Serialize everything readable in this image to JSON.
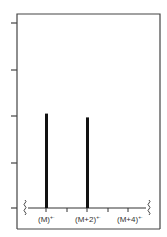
{
  "chart_data": {
    "type": "bar",
    "title": "",
    "xlabel": "",
    "ylabel": "",
    "categories": [
      "(M)+·",
      "(M+2)+·",
      "(M+4)+·"
    ],
    "values": [
      51,
      49,
      0
    ],
    "ylim": [
      0,
      100
    ],
    "y_ticks_count": 5,
    "y_tick_labels": [],
    "x_minor_ticks": 5,
    "grid": false,
    "legend": null,
    "axis_break_marks": [
      "left",
      "right"
    ],
    "bar_color": "#111111",
    "frame_color": "#444444"
  },
  "labels": {
    "m": "(M)",
    "m2": "(M+2)",
    "m4": "(M+4)",
    "sup": "+·"
  }
}
